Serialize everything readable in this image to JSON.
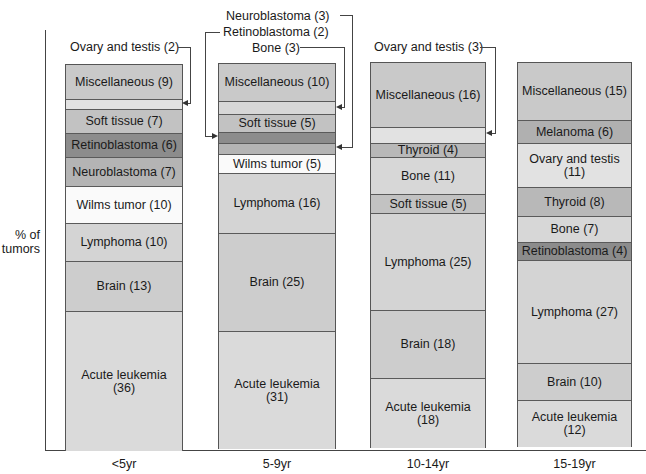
{
  "chart_data": {
    "type": "bar",
    "stacked": true,
    "title": "",
    "xlabel": "",
    "ylabel": "% of tumors",
    "categories": [
      "<5yr",
      "5-9yr",
      "10-14yr",
      "15-19yr"
    ],
    "grid": false,
    "legend": "none (labels inside segments)",
    "bars": [
      {
        "category": "<5yr",
        "segments_bottom_to_top": [
          {
            "name": "Acute leukemia",
            "value": 36
          },
          {
            "name": "Brain",
            "value": 13
          },
          {
            "name": "Lymphoma",
            "value": 10
          },
          {
            "name": "Wilms tumor",
            "value": 10
          },
          {
            "name": "Neuroblastoma",
            "value": 7
          },
          {
            "name": "Retinoblastoma",
            "value": 6
          },
          {
            "name": "Soft tissue",
            "value": 7
          },
          {
            "name": "Ovary and testis",
            "value": 2
          },
          {
            "name": "Miscellaneous",
            "value": 9
          }
        ]
      },
      {
        "category": "5-9yr",
        "segments_bottom_to_top": [
          {
            "name": "Acute leukemia",
            "value": 31
          },
          {
            "name": "Brain",
            "value": 25
          },
          {
            "name": "Lymphoma",
            "value": 16
          },
          {
            "name": "Wilms tumor",
            "value": 5
          },
          {
            "name": "Neuroblastoma",
            "value": 3
          },
          {
            "name": "Retinoblastoma",
            "value": 2
          },
          {
            "name": "Soft tissue",
            "value": 5
          },
          {
            "name": "Bone",
            "value": 3
          },
          {
            "name": "Miscellaneous",
            "value": 10
          }
        ]
      },
      {
        "category": "10-14yr",
        "segments_bottom_to_top": [
          {
            "name": "Acute leukemia",
            "value": 18
          },
          {
            "name": "Brain",
            "value": 18
          },
          {
            "name": "Lymphoma",
            "value": 25
          },
          {
            "name": "Soft tissue",
            "value": 5
          },
          {
            "name": "Bone",
            "value": 11
          },
          {
            "name": "Thyroid",
            "value": 4
          },
          {
            "name": "Ovary and testis",
            "value": 3
          },
          {
            "name": "Miscellaneous",
            "value": 16
          }
        ]
      },
      {
        "category": "15-19yr",
        "segments_bottom_to_top": [
          {
            "name": "Acute leukemia",
            "value": 12
          },
          {
            "name": "Brain",
            "value": 10
          },
          {
            "name": "Lymphoma",
            "value": 27
          },
          {
            "name": "Retinoblastoma",
            "value": 4
          },
          {
            "name": "Bone",
            "value": 7
          },
          {
            "name": "Thyroid",
            "value": 8
          },
          {
            "name": "Ovary and testis",
            "value": 11
          },
          {
            "name": "Melanoma",
            "value": 6
          },
          {
            "name": "Miscellaneous",
            "value": 15
          }
        ]
      }
    ],
    "ylim": [
      0,
      100
    ]
  },
  "axis": {
    "ylabel_line1": "% of",
    "ylabel_line2": "tumors",
    "x_ticks": [
      "<5yr",
      "5-9yr",
      "10-14yr",
      "15-19yr"
    ]
  },
  "annotations": {
    "b1_ovary": "Ovary and testis (2)",
    "b2_neuro": "Neuroblastoma (3)",
    "b2_retino": "Retinoblastoma (2)",
    "b2_bone": "Bone (3)",
    "b3_ovary": "Ovary and testis (3)"
  },
  "bars": [
    {
      "segments": [
        {
          "label": "Miscellaneous (9)",
          "color": "#c9c9c9",
          "top": 0,
          "h": 34
        },
        {
          "label": "",
          "color": "#e2e2e2",
          "top": 34,
          "h": 10
        },
        {
          "label": "Soft tissue (7)",
          "color": "#c2c2c2",
          "top": 44,
          "h": 24
        },
        {
          "label": "Retinoblastoma (6)",
          "color": "#8c8c8c",
          "top": 68,
          "h": 24
        },
        {
          "label": "Neuroblastoma (7)",
          "color": "#b4b4b4",
          "top": 92,
          "h": 29
        },
        {
          "label": "Wilms tumor (10)",
          "color": "#fafafa",
          "top": 121,
          "h": 37
        },
        {
          "label": "Lymphoma (10)",
          "color": "#d4d4d4",
          "top": 158,
          "h": 38
        },
        {
          "label": "Brain (13)",
          "color": "#cdcdcd",
          "top": 196,
          "h": 50
        },
        {
          "label": "Acute leukemia\n(36)",
          "color": "#dadada",
          "top": 246,
          "h": 140
        }
      ]
    },
    {
      "segments": [
        {
          "label": "Miscellaneous (10)",
          "color": "#c9c9c9",
          "top": 0,
          "h": 37
        },
        {
          "label": "",
          "color": "#d7d7d7",
          "top": 37,
          "h": 13
        },
        {
          "label": "Soft tissue (5)",
          "color": "#c2c2c2",
          "top": 50,
          "h": 18
        },
        {
          "label": "",
          "color": "#8c8c8c",
          "top": 68,
          "h": 11
        },
        {
          "label": "",
          "color": "#b4b4b4",
          "top": 79,
          "h": 11
        },
        {
          "label": "Wilms tumor (5)",
          "color": "#fafafa",
          "top": 90,
          "h": 19
        },
        {
          "label": "Lymphoma (16)",
          "color": "#d4d4d4",
          "top": 109,
          "h": 60
        },
        {
          "label": "Brain (25)",
          "color": "#cdcdcd",
          "top": 169,
          "h": 98
        },
        {
          "label": "Acute leukemia\n(31)",
          "color": "#dadada",
          "top": 267,
          "h": 118
        }
      ]
    },
    {
      "segments": [
        {
          "label": "Miscellaneous (16)",
          "color": "#c9c9c9",
          "top": 0,
          "h": 64
        },
        {
          "label": "",
          "color": "#e2e2e2",
          "top": 64,
          "h": 16
        },
        {
          "label": "Thyroid (4)",
          "color": "#b8b8b8",
          "top": 80,
          "h": 14
        },
        {
          "label": "Bone (11)",
          "color": "#d7d7d7",
          "top": 94,
          "h": 37
        },
        {
          "label": "Soft tissue (5)",
          "color": "#c2c2c2",
          "top": 131,
          "h": 19
        },
        {
          "label": "Lymphoma (25)",
          "color": "#d4d4d4",
          "top": 150,
          "h": 97
        },
        {
          "label": "Brain (18)",
          "color": "#cdcdcd",
          "top": 247,
          "h": 68
        },
        {
          "label": "Acute leukemia\n(18)",
          "color": "#dadada",
          "top": 315,
          "h": 70
        }
      ]
    },
    {
      "segments": [
        {
          "label": "Miscellaneous (15)",
          "color": "#c9c9c9",
          "top": 0,
          "h": 57
        },
        {
          "label": "Melanoma (6)",
          "color": "#b0b0b0",
          "top": 57,
          "h": 23
        },
        {
          "label": "Ovary and testis\n(11)",
          "color": "#e2e2e2",
          "top": 80,
          "h": 44
        },
        {
          "label": "Thyroid (8)",
          "color": "#b8b8b8",
          "top": 124,
          "h": 29
        },
        {
          "label": "Bone (7)",
          "color": "#d7d7d7",
          "top": 153,
          "h": 26
        },
        {
          "label": "Retinoblastoma (4)",
          "color": "#8c8c8c",
          "top": 179,
          "h": 18
        },
        {
          "label": "Lymphoma (27)",
          "color": "#d4d4d4",
          "top": 197,
          "h": 103
        },
        {
          "label": "Brain (10)",
          "color": "#cdcdcd",
          "top": 300,
          "h": 37
        },
        {
          "label": "Acute leukemia\n(12)",
          "color": "#dadada",
          "top": 337,
          "h": 47
        }
      ]
    }
  ]
}
